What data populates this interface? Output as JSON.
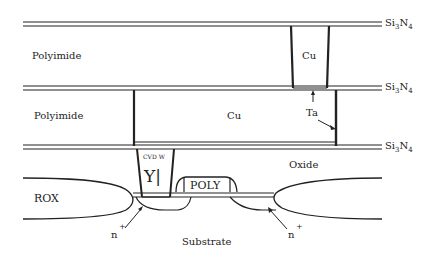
{
  "diagram": {
    "type": "semiconductor cross-section",
    "layers": {
      "si3n4_label": "Si",
      "si3n4_sub1": "3",
      "si3n4_mid": "N",
      "si3n4_sub2": "4",
      "polyimide_top": "Polyimide",
      "polyimide_mid": "Polyimide",
      "oxide": "Oxide",
      "rox": "ROX",
      "substrate": "Substrate"
    },
    "features": {
      "cu_via": "Cu",
      "cu_line": "Cu",
      "ta": "Ta",
      "cvd_w": "CVD W",
      "w_glyph": "Y|",
      "poly": "POLY",
      "n_plus_left": "n",
      "n_plus_right": "n",
      "plus": "+"
    }
  }
}
